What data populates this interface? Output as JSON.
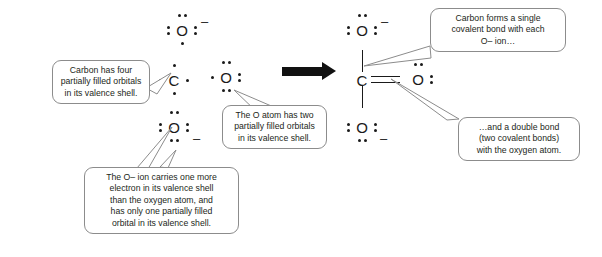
{
  "diagram": {
    "arrow_icon": "reaction-arrow-right",
    "colors": {
      "ink": "#1a1a1a",
      "callout_border": "#8c8c8c",
      "callout_fill": "#ffffff",
      "arrow": "#111111",
      "background": "#ffffff"
    }
  },
  "reactants": {
    "oxide_ion_top": {
      "symbol": "O",
      "charge": "–",
      "dots": 7,
      "name": "oxide-ion-top"
    },
    "carbon_atom": {
      "symbol": "C",
      "charge": "",
      "dots": 4,
      "name": "carbon-atom"
    },
    "oxygen_atom": {
      "symbol": "O",
      "charge": "",
      "dots": 6,
      "name": "oxygen-atom"
    },
    "oxide_ion_bottom": {
      "symbol": "O",
      "charge": "–",
      "dots": 7,
      "name": "oxide-ion-bottom"
    }
  },
  "products": {
    "oxide_ion_top": {
      "symbol": "O",
      "charge": "–",
      "dots": 6,
      "name": "product-oxide-ion-top"
    },
    "carbon_atom": {
      "symbol": "C",
      "charge": "",
      "dots": 0,
      "name": "product-carbon-atom"
    },
    "oxygen_atom": {
      "symbol": "O",
      "charge": "",
      "dots": 4,
      "name": "product-oxygen-atom"
    },
    "oxide_ion_bottom": {
      "symbol": "O",
      "charge": "–",
      "dots": 6,
      "name": "product-oxide-ion-bottom"
    },
    "bonds": [
      {
        "type": "single",
        "between": "C-O top"
      },
      {
        "type": "single",
        "between": "C-O bottom"
      },
      {
        "type": "double",
        "between": "C=O right"
      }
    ]
  },
  "callouts": {
    "carbon": {
      "lines": [
        "Carbon has four",
        "partially filled orbitals",
        "in its valence shell."
      ]
    },
    "oxygen_atom": {
      "lines": [
        "The O atom has two",
        "partially filled orbitals",
        "in its valence shell."
      ]
    },
    "oxide_ion": {
      "lines": [
        "The O– ion carries one more",
        "electron in its valence shell",
        "than the oxygen atom, and",
        "has only one partially filled",
        "orbital in its valence shell."
      ]
    },
    "single_bond": {
      "lines": [
        "Carbon forms a single",
        "covalent bond with each",
        "O– ion…"
      ]
    },
    "double_bond": {
      "lines": [
        "…and a double bond",
        "(two covalent bonds)",
        "with the oxygen atom."
      ]
    }
  }
}
